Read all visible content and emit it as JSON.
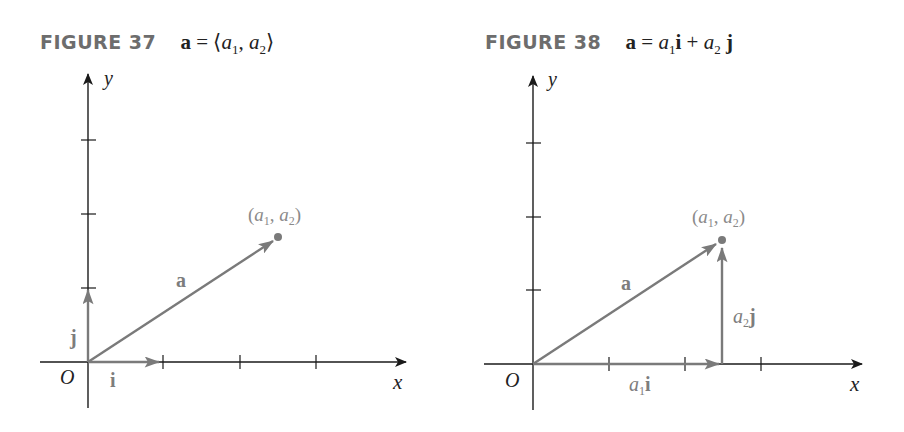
{
  "figures": [
    {
      "id": "fig37",
      "label": "FIGURE 37",
      "equation": {
        "lhs": "a",
        "eq": " = ",
        "rhs_parts": [
          "⟨",
          "a",
          "1",
          ", ",
          "a",
          "2",
          "⟩"
        ]
      },
      "axis_labels": {
        "x": "x",
        "y": "y",
        "origin": "O"
      },
      "vector_labels": {
        "a": "a",
        "i": "i",
        "j": "j"
      },
      "point_label": {
        "open": "(",
        "a1": "a",
        "s1": "1",
        "comma": ", ",
        "a2": "a",
        "s2": "2",
        "close": ")"
      }
    },
    {
      "id": "fig38",
      "label": "FIGURE 38",
      "equation": {
        "lhs": "a",
        "eq": " = ",
        "t1": "a",
        "s1": "1",
        "u1": "i",
        "plus": " + ",
        "t2": "a",
        "s2": "2",
        "u2": "j"
      },
      "axis_labels": {
        "x": "x",
        "y": "y",
        "origin": "O"
      },
      "vector_labels": {
        "a": "a",
        "a1i": {
          "coef": "a",
          "sub": "1",
          "unit": "i"
        },
        "a2j": {
          "coef": "a",
          "sub": "2",
          "unit": "j"
        }
      },
      "point_label": {
        "open": "(",
        "a1": "a",
        "s1": "1",
        "comma": ", ",
        "a2": "a",
        "s2": "2",
        "close": ")"
      }
    }
  ],
  "colors": {
    "axis": "#1a1a1a",
    "vector": "#7a7a7a",
    "label_gray": "#7d7d7d",
    "caption_gray": "#6d6d6d"
  }
}
